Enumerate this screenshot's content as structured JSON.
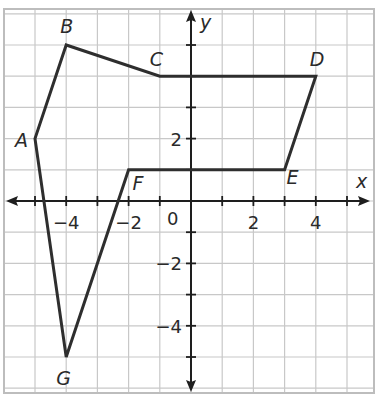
{
  "figure": {
    "type": "coordinate-plane-polygon",
    "axes": {
      "x_label": "x",
      "y_label": "y",
      "origin_label": "0",
      "x_ticks": [
        {
          "value": -4,
          "label": "−4"
        },
        {
          "value": -2,
          "label": "−2"
        },
        {
          "value": 2,
          "label": "2"
        },
        {
          "value": 4,
          "label": "4"
        }
      ],
      "y_ticks": [
        {
          "value": 2,
          "label": "2"
        },
        {
          "value": -2,
          "label": "−2"
        },
        {
          "value": -4,
          "label": "−4"
        }
      ],
      "x_range": [
        -6,
        6
      ],
      "y_range": [
        -6,
        6
      ],
      "grid": true,
      "grid_step": 1
    },
    "polygon": {
      "stroke_color": "#2e2e2e",
      "vertices": [
        {
          "name": "A",
          "x": -5,
          "y": 2
        },
        {
          "name": "B",
          "x": -4,
          "y": 5
        },
        {
          "name": "C",
          "x": -1,
          "y": 4
        },
        {
          "name": "D",
          "x": 4,
          "y": 4
        },
        {
          "name": "E",
          "x": 3,
          "y": 1
        },
        {
          "name": "F",
          "x": -2,
          "y": 1
        },
        {
          "name": "G",
          "x": -4,
          "y": -5
        }
      ]
    },
    "colors": {
      "grid": "#c8c8c8",
      "axis": "#1e1e1e",
      "border": "#bdbdbd"
    }
  }
}
